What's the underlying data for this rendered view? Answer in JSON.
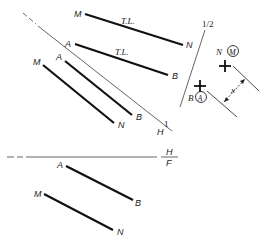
{
  "figure": {
    "type": "descriptive-geometry-auxiliary-views",
    "colors": {
      "line": "#111111",
      "fold_line": "#555555",
      "background": "#ffffff"
    },
    "fold_lines": [
      {
        "id": "H-1",
        "label_top": "1",
        "label_bottom": "H"
      },
      {
        "id": "1-2",
        "label": "1/2"
      },
      {
        "id": "H-F",
        "label_top": "H",
        "label_bottom": "F"
      }
    ],
    "auxiliary_view_1": {
      "line_MN": {
        "start": "M",
        "end": "N",
        "annotation": "T.L."
      },
      "line_AB": {
        "start": "A",
        "end": "B",
        "annotation": "T.L."
      }
    },
    "auxiliary_view_2": {
      "point_view_MN": {
        "label": "N",
        "circled": "M"
      },
      "point_view_AB": {
        "label": "B",
        "circled": "A"
      },
      "distance_label": "x"
    },
    "top_view": {
      "line_AB": {
        "start": "A",
        "end": "B"
      },
      "line_MN": {
        "start": "M",
        "end": "N"
      }
    },
    "front_view": {
      "line_AB": {
        "start": "A",
        "end": "B"
      },
      "line_MN": {
        "start": "M",
        "end": "N"
      }
    }
  }
}
